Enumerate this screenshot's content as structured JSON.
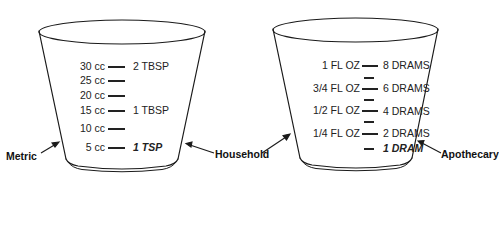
{
  "figure": {
    "stroke_color": "#1a1a1a",
    "background": "#ffffff"
  },
  "metric_cup": {
    "callout_left": "Metric",
    "callout_right": "Household",
    "marks": [
      {
        "metric": "30 cc",
        "household": "2 TBSP",
        "emphasis": false
      },
      {
        "metric": "25 cc",
        "household": "",
        "emphasis": false
      },
      {
        "metric": "20 cc",
        "household": "",
        "emphasis": false
      },
      {
        "metric": "15 cc",
        "household": "1 TBSP",
        "emphasis": false
      },
      {
        "metric": "10 cc",
        "household": "",
        "emphasis": false
      },
      {
        "metric": "5 cc",
        "household": "1 TSP",
        "emphasis": true
      }
    ]
  },
  "apothecary_cup": {
    "callout_left": "Household",
    "callout_right": "Apothecary",
    "marks": [
      {
        "household": "1 FL OZ",
        "apothecary": "8 DRAMS",
        "emphasis": false
      },
      {
        "household": "3/4 FL OZ",
        "apothecary": "6 DRAMS",
        "emphasis": false
      },
      {
        "household": "1/2 FL OZ",
        "apothecary": "4 DRAMS",
        "emphasis": false
      },
      {
        "household": "1/4 FL OZ",
        "apothecary": "2 DRAMS",
        "emphasis": false
      },
      {
        "household": "",
        "apothecary": "1 DRAM",
        "emphasis": true
      }
    ]
  }
}
